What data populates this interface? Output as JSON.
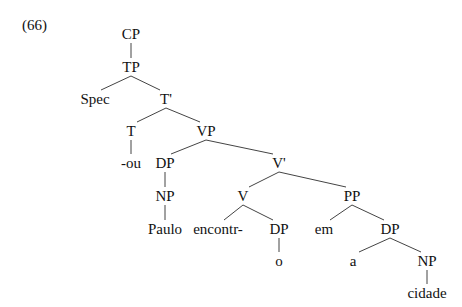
{
  "example_number": "(66)",
  "tree": {
    "nodes": [
      {
        "id": "cp",
        "label": "CP",
        "x": 131,
        "y": 34
      },
      {
        "id": "tp",
        "label": "TP",
        "x": 131,
        "y": 67
      },
      {
        "id": "spec",
        "label": "Spec",
        "x": 95,
        "y": 99
      },
      {
        "id": "tbar",
        "label": "T'",
        "x": 166,
        "y": 99
      },
      {
        "id": "t",
        "label": "T",
        "x": 131,
        "y": 131
      },
      {
        "id": "vp",
        "label": "VP",
        "x": 206,
        "y": 131
      },
      {
        "id": "ou",
        "label": "-ou",
        "x": 131,
        "y": 163
      },
      {
        "id": "dp1",
        "label": "DP",
        "x": 165,
        "y": 163
      },
      {
        "id": "vbar",
        "label": "V'",
        "x": 279,
        "y": 163
      },
      {
        "id": "np1",
        "label": "NP",
        "x": 165,
        "y": 196
      },
      {
        "id": "v",
        "label": "V",
        "x": 243,
        "y": 196
      },
      {
        "id": "pp",
        "label": "PP",
        "x": 352,
        "y": 196
      },
      {
        "id": "paulo",
        "label": "Paulo",
        "x": 165,
        "y": 229
      },
      {
        "id": "encontr",
        "label": "encontr-",
        "x": 218,
        "y": 229
      },
      {
        "id": "dp2",
        "label": "DP",
        "x": 279,
        "y": 229
      },
      {
        "id": "em",
        "label": "em",
        "x": 324,
        "y": 229
      },
      {
        "id": "dp3",
        "label": "DP",
        "x": 390,
        "y": 229
      },
      {
        "id": "o",
        "label": "o",
        "x": 279,
        "y": 261
      },
      {
        "id": "a",
        "label": "a",
        "x": 353,
        "y": 261
      },
      {
        "id": "np2",
        "label": "NP",
        "x": 427,
        "y": 261
      },
      {
        "id": "cidade",
        "label": "cidade",
        "x": 427,
        "y": 293
      }
    ],
    "edges": [
      [
        "cp",
        "tp"
      ],
      [
        "tp",
        "spec"
      ],
      [
        "tp",
        "tbar"
      ],
      [
        "tbar",
        "t"
      ],
      [
        "tbar",
        "vp"
      ],
      [
        "t",
        "ou"
      ],
      [
        "vp",
        "dp1"
      ],
      [
        "vp",
        "vbar"
      ],
      [
        "dp1",
        "np1"
      ],
      [
        "np1",
        "paulo"
      ],
      [
        "vbar",
        "v"
      ],
      [
        "vbar",
        "pp"
      ],
      [
        "v",
        "encontr"
      ],
      [
        "v",
        "dp2"
      ],
      [
        "dp2",
        "o"
      ],
      [
        "pp",
        "em"
      ],
      [
        "pp",
        "dp3"
      ],
      [
        "dp3",
        "a"
      ],
      [
        "dp3",
        "np2"
      ],
      [
        "np2",
        "cidade"
      ]
    ]
  }
}
